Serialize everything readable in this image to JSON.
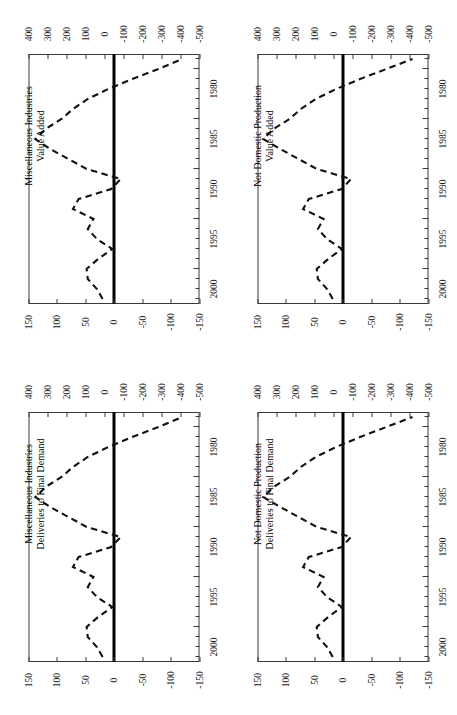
{
  "figure": {
    "panel_count": 4,
    "orientation": "rotated-90-ccw",
    "line_style": "dashed",
    "zero_line_color": "#000000",
    "line_color": "#111111",
    "axis_color": "#3a3a3a",
    "background": "#ffffff"
  },
  "chart_data": [
    {
      "type": "line",
      "panel": "top-left",
      "title": "Miscellaneous Industries",
      "subtitle": "Value Added",
      "xlabel": "",
      "ylabel": "",
      "grid": false,
      "legend": "none",
      "x": [
        1977,
        1978,
        1979,
        1980,
        1981,
        1982,
        1983,
        1984,
        1985,
        1986,
        1987,
        1988,
        1989,
        1990,
        1991,
        1992,
        1993,
        1994,
        1995,
        1996,
        1997,
        1998,
        1999,
        2000,
        2001
      ],
      "xlim": [
        1976.5,
        2001.5
      ],
      "xticks_major": [
        1980,
        1985,
        1990,
        1995,
        2000
      ],
      "xtick_labels": [
        "1980",
        "1985",
        "1990",
        "1995",
        "2000"
      ],
      "primary_axis": {
        "name": "bottom-axis",
        "ticks": [
          150,
          100,
          50,
          0,
          -50,
          -100,
          -150
        ],
        "labels": [
          "150",
          "100",
          "50",
          "0",
          "-50",
          "-100",
          "-150"
        ],
        "lim": [
          150,
          -150
        ]
      },
      "secondary_axis": {
        "name": "top-axis",
        "ticks": [
          400,
          300,
          200,
          100,
          0,
          -100,
          -200,
          -300,
          -400,
          -500
        ],
        "labels": [
          "400",
          "300",
          "200",
          "100",
          "0",
          "-100",
          "-200",
          "-300",
          "-400",
          "-500"
        ],
        "lim": [
          400,
          -500
        ]
      },
      "values": [
        20,
        30,
        46,
        48,
        28,
        3,
        30,
        46,
        36,
        72,
        62,
        5,
        -12,
        48,
        80,
        112,
        138,
        120,
        92,
        72,
        46,
        10,
        -32,
        -78,
        -120
      ],
      "zero_reference": 0
    },
    {
      "type": "line",
      "panel": "top-right",
      "title": "Not Domestic Production",
      "subtitle": "Value Added",
      "xlabel": "",
      "ylabel": "",
      "grid": false,
      "legend": "none",
      "x": [
        1977,
        1978,
        1979,
        1980,
        1981,
        1982,
        1983,
        1984,
        1985,
        1986,
        1987,
        1988,
        1989,
        1990,
        1991,
        1992,
        1993,
        1994,
        1995,
        1996,
        1997,
        1998,
        1999,
        2000,
        2001
      ],
      "xlim": [
        1976.5,
        2001.5
      ],
      "xticks_major": [
        1980,
        1985,
        1990,
        1995,
        2000
      ],
      "xtick_labels": [
        "1980",
        "1985",
        "1990",
        "1995",
        "2000"
      ],
      "primary_axis": {
        "name": "bottom-axis",
        "ticks": [
          150,
          100,
          50,
          0,
          -50,
          -100,
          -150
        ],
        "labels": [
          "150",
          "100",
          "50",
          "0",
          "-50",
          "-100",
          "-150"
        ],
        "lim": [
          150,
          -150
        ]
      },
      "secondary_axis": {
        "name": "top-axis",
        "ticks": [
          400,
          300,
          200,
          100,
          0,
          -100,
          -200,
          -300,
          -400,
          -500
        ],
        "labels": [
          "400",
          "300",
          "200",
          "100",
          "0",
          "-100",
          "-200",
          "-300",
          "-400",
          "-500"
        ],
        "lim": [
          400,
          -500
        ]
      },
      "values": [
        18,
        28,
        44,
        46,
        26,
        2,
        28,
        44,
        34,
        70,
        60,
        2,
        -14,
        46,
        78,
        110,
        140,
        122,
        94,
        74,
        48,
        12,
        -30,
        -76,
        -122
      ],
      "zero_reference": 0
    },
    {
      "type": "line",
      "panel": "bottom-left",
      "title": "Miscellaneous Industries",
      "subtitle": "Deliveries to Final Demand",
      "xlabel": "",
      "ylabel": "",
      "grid": false,
      "legend": "none",
      "x": [
        1977,
        1978,
        1979,
        1980,
        1981,
        1982,
        1983,
        1984,
        1985,
        1986,
        1987,
        1988,
        1989,
        1990,
        1991,
        1992,
        1993,
        1994,
        1995,
        1996,
        1997,
        1998,
        1999,
        2000,
        2001
      ],
      "xlim": [
        1976.5,
        2001.5
      ],
      "xticks_major": [
        1980,
        1985,
        1990,
        1995,
        2000
      ],
      "xtick_labels": [
        "1980",
        "1985",
        "1990",
        "1995",
        "2000"
      ],
      "primary_axis": {
        "name": "bottom-axis",
        "ticks": [
          150,
          100,
          50,
          0,
          -50,
          -100,
          -150
        ],
        "labels": [
          "150",
          "100",
          "50",
          "0",
          "-50",
          "-100",
          "-150"
        ],
        "lim": [
          150,
          -150
        ]
      },
      "secondary_axis": {
        "name": "top-axis",
        "ticks": [
          400,
          300,
          200,
          100,
          0,
          -100,
          -200,
          -300,
          -400,
          -500
        ],
        "labels": [
          "400",
          "300",
          "200",
          "100",
          "0",
          "-100",
          "-200",
          "-300",
          "-400",
          "-500"
        ],
        "lim": [
          400,
          -500
        ]
      },
      "values": [
        20,
        30,
        46,
        48,
        28,
        3,
        30,
        46,
        36,
        72,
        62,
        5,
        -12,
        48,
        80,
        112,
        138,
        120,
        92,
        72,
        46,
        10,
        -32,
        -78,
        -120
      ],
      "zero_reference": 0
    },
    {
      "type": "line",
      "panel": "bottom-right",
      "title": "Not Domestic Production",
      "subtitle": "Deliveries to Final Demand",
      "xlabel": "",
      "ylabel": "",
      "grid": false,
      "legend": "none",
      "x": [
        1977,
        1978,
        1979,
        1980,
        1981,
        1982,
        1983,
        1984,
        1985,
        1986,
        1987,
        1988,
        1989,
        1990,
        1991,
        1992,
        1993,
        1994,
        1995,
        1996,
        1997,
        1998,
        1999,
        2000,
        2001
      ],
      "xlim": [
        1976.5,
        2001.5
      ],
      "xticks_major": [
        1980,
        1985,
        1990,
        1995,
        2000
      ],
      "xtick_labels": [
        "1980",
        "1985",
        "1990",
        "1995",
        "2000"
      ],
      "primary_axis": {
        "name": "bottom-axis",
        "ticks": [
          150,
          100,
          50,
          0,
          -50,
          -100,
          -150
        ],
        "labels": [
          "150",
          "100",
          "50",
          "0",
          "-50",
          "-100",
          "-150"
        ],
        "lim": [
          150,
          -150
        ]
      },
      "secondary_axis": {
        "name": "top-axis",
        "ticks": [
          400,
          300,
          200,
          100,
          0,
          -100,
          -200,
          -300,
          -400,
          -500
        ],
        "labels": [
          "400",
          "300",
          "200",
          "100",
          "0",
          "-100",
          "-200",
          "-300",
          "-400",
          "-500"
        ],
        "lim": [
          400,
          -500
        ]
      },
      "values": [
        18,
        28,
        44,
        46,
        26,
        2,
        28,
        44,
        34,
        70,
        60,
        2,
        -14,
        46,
        78,
        110,
        140,
        122,
        94,
        74,
        48,
        12,
        -30,
        -76,
        -122
      ],
      "zero_reference": 0
    }
  ]
}
